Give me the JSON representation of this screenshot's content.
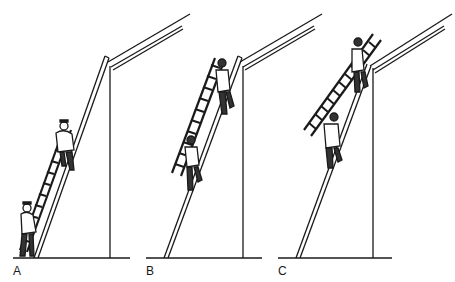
{
  "figure": {
    "panels": [
      {
        "id": "A",
        "label": "A",
        "description": "Two firefighters climbing a ladder set against the building wall"
      },
      {
        "id": "B",
        "label": "B",
        "description": "Firefighters carrying a roof ladder up the wall ladder"
      },
      {
        "id": "C",
        "label": "C",
        "description": "Roof ladder being pushed up onto the roof from the wall ladder"
      }
    ],
    "colors": {
      "line": "#1a1a1a",
      "fill": "#ffffff",
      "figure_shade": "#333333"
    }
  }
}
